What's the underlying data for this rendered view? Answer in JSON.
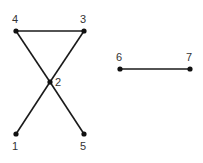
{
  "graph": {
    "nodes": [
      {
        "id": "1",
        "label": "1",
        "x": 16,
        "y": 134,
        "lx": 12,
        "ly": 150
      },
      {
        "id": "2",
        "label": "2",
        "x": 50,
        "y": 82,
        "lx": 55,
        "ly": 86
      },
      {
        "id": "3",
        "label": "3",
        "x": 84,
        "y": 31,
        "lx": 80,
        "ly": 23
      },
      {
        "id": "4",
        "label": "4",
        "x": 16,
        "y": 31,
        "lx": 12,
        "ly": 23
      },
      {
        "id": "5",
        "label": "5",
        "x": 84,
        "y": 134,
        "lx": 80,
        "ly": 150
      },
      {
        "id": "6",
        "label": "6",
        "x": 120,
        "y": 69,
        "lx": 116,
        "ly": 61
      },
      {
        "id": "7",
        "label": "7",
        "x": 190,
        "y": 69,
        "lx": 186,
        "ly": 61
      }
    ],
    "edges": [
      {
        "from": "4",
        "to": "3"
      },
      {
        "from": "4",
        "to": "2"
      },
      {
        "from": "2",
        "to": "5"
      },
      {
        "from": "3",
        "to": "2"
      },
      {
        "from": "2",
        "to": "1"
      },
      {
        "from": "6",
        "to": "7"
      }
    ]
  }
}
